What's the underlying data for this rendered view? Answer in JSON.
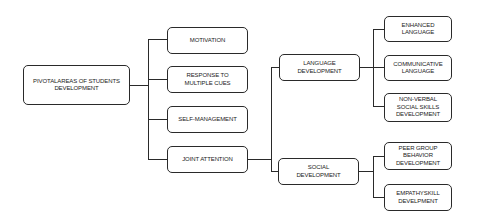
{
  "diagram": {
    "type": "tree",
    "root": {
      "label": "PIVOTALAREAS OF STUDENTS DEVELOPMENT"
    },
    "level1": [
      {
        "label": "MOTIVATION"
      },
      {
        "label": "RESPONSE TO MULTIPLE CUES"
      },
      {
        "label": "SELF-MANAGEMENT"
      },
      {
        "label": "JOINT ATTENTION"
      }
    ],
    "level2": [
      {
        "label": "LANGUAGE DEVELOPMENT",
        "parent": "JOINT ATTENTION"
      },
      {
        "label": "SOCIAL DEVELOPMENT",
        "parent": "JOINT ATTENTION"
      }
    ],
    "level3": [
      {
        "label": "ENHANCED LANGUAGE",
        "parent": "LANGUAGE DEVELOPMENT"
      },
      {
        "label": "COMMUNICATIVE LANGUAGE",
        "parent": "LANGUAGE DEVELOPMENT"
      },
      {
        "label": "NON-VERBAL SOCIAL SKILLS DEVELOPMENT",
        "parent": "LANGUAGE DEVELOPMENT"
      },
      {
        "label": "PEER GROUP BEHAVIOR DEVELOPMENT",
        "parent": "SOCIAL DEVELOPMENT"
      },
      {
        "label": "EMPATHYSKILL DEVELPMENT",
        "parent": "SOCIAL DEVELOPMENT"
      }
    ]
  }
}
